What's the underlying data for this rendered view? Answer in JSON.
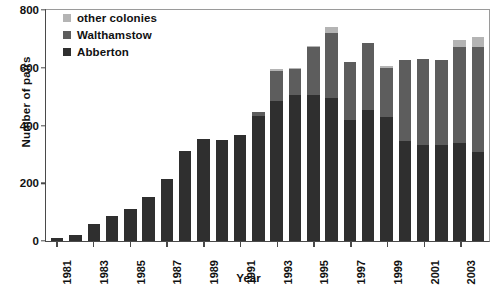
{
  "chart_data": {
    "type": "bar",
    "title": "",
    "subtitle": "",
    "stacked": true,
    "xlabel": "Year",
    "ylabel": "Number of pairs",
    "ylim": [
      0,
      800
    ],
    "yticks": [
      0,
      200,
      400,
      600,
      800
    ],
    "grid": false,
    "legend_position": "top-left",
    "categories": [
      "1981",
      "1982",
      "1983",
      "1984",
      "1985",
      "1986",
      "1987",
      "1988",
      "1989",
      "1990",
      "1991",
      "1992",
      "1993",
      "1994",
      "1995",
      "1996",
      "1997",
      "1998",
      "1999",
      "2000",
      "2001",
      "2002",
      "2003",
      "2004"
    ],
    "xtick_labels": [
      "1981",
      "1983",
      "1985",
      "1987",
      "1989",
      "1991",
      "1993",
      "1995",
      "1997",
      "1999",
      "2001",
      "2003"
    ],
    "series": [
      {
        "name": "Abberton",
        "color": "#2f2f2f",
        "values": [
          10,
          22,
          58,
          85,
          110,
          150,
          212,
          310,
          350,
          348,
          363,
          430,
          480,
          500,
          500,
          490,
          415,
          450,
          425,
          345,
          330,
          330,
          335,
          305
        ]
      },
      {
        "name": "Walthamstow",
        "color": "#5d5d5d",
        "values": [
          0,
          0,
          0,
          0,
          0,
          0,
          0,
          0,
          0,
          0,
          0,
          12,
          105,
          90,
          165,
          225,
          200,
          230,
          170,
          278,
          295,
          293,
          330,
          360
        ]
      },
      {
        "name": "other colonies",
        "color": "#b4b4b4",
        "values": [
          0,
          0,
          0,
          0,
          0,
          0,
          0,
          0,
          0,
          0,
          0,
          0,
          5,
          5,
          5,
          20,
          0,
          0,
          5,
          0,
          0,
          0,
          25,
          35
        ]
      }
    ],
    "totals": [
      10,
      22,
      58,
      85,
      110,
      150,
      212,
      310,
      350,
      348,
      363,
      442,
      590,
      595,
      670,
      735,
      615,
      680,
      600,
      623,
      625,
      623,
      690,
      700
    ]
  },
  "legend": {
    "items": [
      {
        "label": "other colonies",
        "color": "#b4b4b4"
      },
      {
        "label": "Walthamstow",
        "color": "#5d5d5d"
      },
      {
        "label": "Abberton",
        "color": "#2f2f2f"
      }
    ]
  }
}
